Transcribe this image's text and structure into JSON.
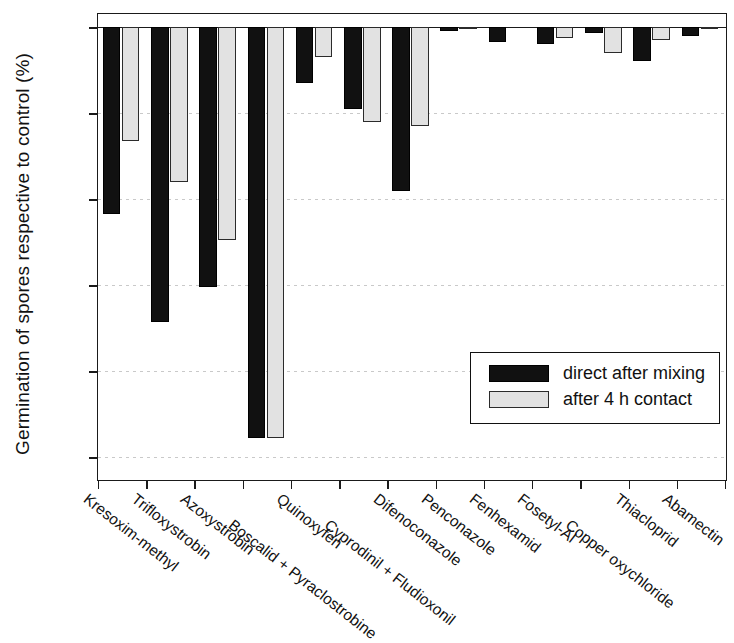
{
  "chart_data": {
    "type": "bar",
    "title": "",
    "xlabel": "",
    "ylabel": "Germination of spores respective to control (%)",
    "ylim": [
      -105,
      3
    ],
    "yticks": [
      0,
      -20,
      -40,
      -60,
      -80,
      -100
    ],
    "ytick_labels": [
      "0",
      "-20",
      "-40",
      "-60",
      "-80",
      "-100"
    ],
    "grid": true,
    "legend_position": "center-right",
    "categories": [
      "Kresoxim-methyl",
      "Trifloxystrobin",
      "Azoxystrobin",
      "Boscalid + Pyraclostrobine",
      "Quinoxyfen",
      "Cyprodinil + Fludioxonil",
      "Difenoconazole",
      "Penconazole",
      "Fenhexamid",
      "Fosetyl-Al",
      "Copper oxychloride",
      "Thiacloprid",
      "Abamectin"
    ],
    "series": [
      {
        "name": "direct after mixing",
        "color": "#111111",
        "values": [
          -43.5,
          -68.5,
          -60.5,
          -95.5,
          -13.0,
          -19.0,
          -38.0,
          -1.0,
          -3.5,
          -4.0,
          -1.5,
          -8.0,
          -2.0
        ]
      },
      {
        "name": "after 4 h contact",
        "color": "#e2e2e2",
        "values": [
          -26.5,
          -36.0,
          -49.5,
          -95.5,
          -7.0,
          -22.0,
          -23.0,
          -0.5,
          0.0,
          -2.5,
          -6.0,
          -3.0,
          -0.5
        ]
      }
    ]
  },
  "legend": {
    "items": [
      {
        "label": "direct after mixing",
        "style": "dark"
      },
      {
        "label": "after 4 h contact",
        "style": "light"
      }
    ]
  }
}
